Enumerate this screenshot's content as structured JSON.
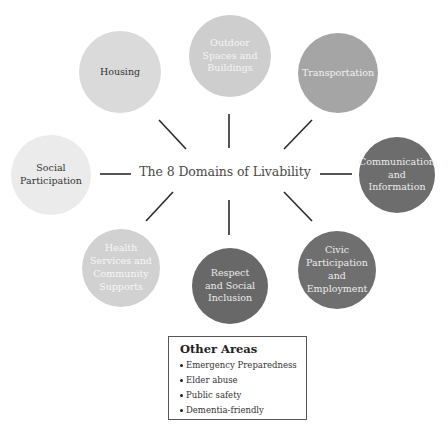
{
  "diagram": {
    "title": "The 8 Domains of Livability",
    "domains": [
      {
        "id": "housing",
        "label": "Housing",
        "fill": "#dadada",
        "text_color": "#333333",
        "cx": 120,
        "cy": 72,
        "r": 41
      },
      {
        "id": "outdoor",
        "label": "Outdoor\nSpaces and\nBuildings",
        "fill": "#cecece",
        "text_color": "#f4f4f4",
        "cx": 230,
        "cy": 56,
        "r": 41
      },
      {
        "id": "transportation",
        "label": "Transportation",
        "fill": "#a5a5a5",
        "text_color": "#f2f2f2",
        "cx": 338,
        "cy": 73,
        "r": 40
      },
      {
        "id": "communication",
        "label": "Communication\nand\nInformation",
        "fill": "#6d6d6d",
        "text_color": "#ececec",
        "cx": 397,
        "cy": 175,
        "r": 38
      },
      {
        "id": "civic",
        "label": "Civic\nParticipation\nand\nEmployment",
        "fill": "#6f6f6f",
        "text_color": "#ececec",
        "cx": 337,
        "cy": 270,
        "r": 39
      },
      {
        "id": "respect",
        "label": "Respect\nand Social\nInclusion",
        "fill": "#686868",
        "text_color": "#ececec",
        "cx": 230,
        "cy": 286,
        "r": 38
      },
      {
        "id": "health",
        "label": "Health\nServices and\nCommunity\nSupports",
        "fill": "#d1d1d1",
        "text_color": "#f6f6f6",
        "cx": 121,
        "cy": 268,
        "r": 39
      },
      {
        "id": "social",
        "label": "Social\nParticipation",
        "fill": "#ebebeb",
        "text_color": "#333333",
        "cx": 51,
        "cy": 175,
        "r": 40
      }
    ]
  },
  "other_areas": {
    "title": "Other Areas",
    "items": [
      "Emergency Preparedness",
      "Elder abuse",
      "Public safety",
      "Dementia-friendly"
    ]
  }
}
